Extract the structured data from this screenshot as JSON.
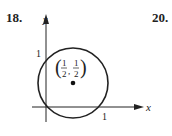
{
  "problems": [
    {
      "number": "18."
    },
    {
      "number": "20."
    }
  ],
  "figure": {
    "axis_x_label": "x",
    "axis_y_label": "y",
    "tick_y": "1",
    "tick_x": "1",
    "center_label": {
      "num": "1",
      "den": "2"
    },
    "circle": {
      "cx": 73,
      "cy": 83,
      "r": 35
    },
    "color": "#222222"
  }
}
